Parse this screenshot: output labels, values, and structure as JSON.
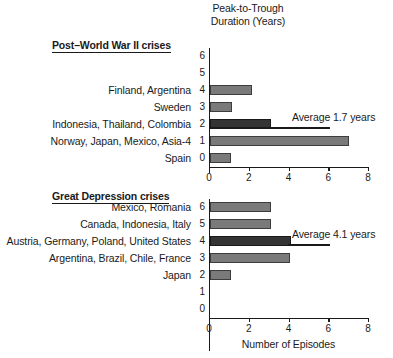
{
  "figure": {
    "axis_title_line1": "Peak-to-Trough",
    "axis_title_line2": "Duration (Years)",
    "xaxis_caption": "Number of Episodes"
  },
  "sections": {
    "postwar": {
      "header": "Post–World War II crises",
      "average_label": "Average 1.7 years"
    },
    "depression": {
      "header": "Great Depression crises",
      "average_label": "Average 4.1 years"
    }
  },
  "ticks": {
    "x": [
      "0",
      "2",
      "4",
      "6",
      "8"
    ],
    "y_postwar": [
      "6",
      "5",
      "4",
      "3",
      "2",
      "1",
      "0"
    ],
    "y_depression": [
      "6",
      "5",
      "4",
      "3",
      "2",
      "1",
      "0"
    ]
  },
  "rows_postwar": [
    {
      "duration": "6",
      "label": ""
    },
    {
      "duration": "5",
      "label": ""
    },
    {
      "duration": "4",
      "label": "Finland, Argentina"
    },
    {
      "duration": "3",
      "label": "Sweden"
    },
    {
      "duration": "2",
      "label": "Indonesia, Thailand, Colombia"
    },
    {
      "duration": "1",
      "label": "Norway, Japan, Mexico, Asia-4"
    },
    {
      "duration": "0",
      "label": "Spain"
    }
  ],
  "rows_depression": [
    {
      "duration": "6",
      "label": "Mexico, Romania"
    },
    {
      "duration": "5",
      "label": "Canada, Indonesia, Italy"
    },
    {
      "duration": "4",
      "label": "Austria, Germany, Poland, United States"
    },
    {
      "duration": "3",
      "label": "Argentina, Brazil, Chile, France"
    },
    {
      "duration": "2",
      "label": "Japan"
    },
    {
      "duration": "1",
      "label": ""
    },
    {
      "duration": "0",
      "label": ""
    }
  ],
  "colors": {
    "bar_fill": "#7a7a7a",
    "bar_fill_highlight": "#343434",
    "bar_stroke": "#3d3d3d",
    "axis": "#1a1a1a",
    "background": "#ffffff"
  },
  "chart_data": [
    {
      "type": "bar",
      "orientation": "horizontal",
      "title": "Post–World War II crises",
      "xlabel": "Number of Episodes",
      "ylabel": "Peak-to-Trough Duration (Years)",
      "xlim": [
        0,
        8
      ],
      "ylim": [
        0,
        6
      ],
      "xticks": [
        0,
        2,
        4,
        6,
        8
      ],
      "yticks": [
        0,
        1,
        2,
        3,
        4,
        5,
        6
      ],
      "grid": false,
      "legend": "none",
      "categories": [
        6,
        5,
        4,
        3,
        2,
        1,
        0
      ],
      "values": [
        0,
        0,
        2.1,
        1.1,
        3.05,
        7.0,
        1.05
      ],
      "category_labels": [
        "",
        "",
        "Finland, Argentina",
        "Sweden",
        "Indonesia, Thailand, Colombia",
        "Norway, Japan, Mexico, Asia-4",
        "Spain"
      ],
      "annotations": [
        {
          "text": "Average 1.7 years",
          "type": "average-line",
          "value": 1.7,
          "line_from_x": 0,
          "line_to_x": 6,
          "at_category": 2
        }
      ]
    },
    {
      "type": "bar",
      "orientation": "horizontal",
      "title": "Great Depression crises",
      "xlabel": "Number of Episodes",
      "ylabel": "Peak-to-Trough Duration (Years)",
      "xlim": [
        0,
        8
      ],
      "ylim": [
        0,
        6
      ],
      "xticks": [
        0,
        2,
        4,
        6,
        8
      ],
      "yticks": [
        0,
        1,
        2,
        3,
        4,
        5,
        6
      ],
      "grid": false,
      "legend": "none",
      "categories": [
        6,
        5,
        4,
        3,
        2,
        1,
        0
      ],
      "values": [
        3.05,
        3.05,
        4.1,
        4.05,
        1.05,
        0,
        0
      ],
      "category_labels": [
        "Mexico, Romania",
        "Canada, Indonesia, Italy",
        "Austria, Germany, Poland, United States",
        "Argentina, Brazil, Chile, France",
        "Japan",
        "",
        ""
      ],
      "annotations": [
        {
          "text": "Average 4.1 years",
          "type": "average-line",
          "value": 4.1,
          "line_from_x": 0,
          "line_to_x": 6,
          "at_category": 4
        }
      ]
    }
  ]
}
